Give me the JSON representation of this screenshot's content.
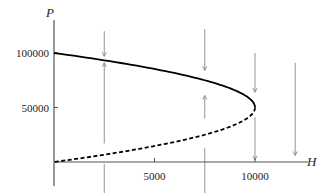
{
  "chart_data": {
    "type": "line",
    "title": "",
    "xlabel": "H",
    "ylabel": "P",
    "xlim": [
      0,
      13000
    ],
    "ylim": [
      -20000,
      115000
    ],
    "x_ticks": [
      5000,
      10000
    ],
    "x_tick_labels": [
      "5000",
      "10000"
    ],
    "y_ticks": [
      50000,
      100000
    ],
    "y_tick_labels": [
      "50000",
      "100000"
    ],
    "grid": false,
    "legend": null,
    "series": [
      {
        "name": "stable equilibrium",
        "style": "solid",
        "color": "#000000",
        "x": [
          0,
          1900,
          3600,
          5100,
          6400,
          7500,
          8400,
          9100,
          9600,
          9900,
          10000
        ],
        "y": [
          100000,
          95000,
          90000,
          85000,
          80000,
          75000,
          70000,
          65000,
          60000,
          55000,
          50000
        ]
      },
      {
        "name": "unstable equilibrium",
        "style": "dashed",
        "color": "#000000",
        "x": [
          10000,
          9900,
          9600,
          9100,
          8400,
          7500,
          6400,
          5100,
          3600,
          1900,
          0
        ],
        "y": [
          50000,
          45000,
          40000,
          35000,
          30000,
          25000,
          20000,
          15000,
          10000,
          5000,
          0
        ]
      }
    ],
    "direction_arrows": [
      {
        "H": 2500,
        "from_P": 120000,
        "to_P": 97000,
        "direction": "down"
      },
      {
        "H": 2500,
        "from_P": 17000,
        "to_P": 91000,
        "direction": "up"
      },
      {
        "H": 2500,
        "from_P": -2000,
        "to_P": -43000,
        "direction": "down"
      },
      {
        "H": 7500,
        "from_P": 122000,
        "to_P": 84000,
        "direction": "down"
      },
      {
        "H": 7500,
        "from_P": 40000,
        "to_P": 61000,
        "direction": "up"
      },
      {
        "H": 7500,
        "from_P": 13000,
        "to_P": -38000,
        "direction": "down"
      },
      {
        "H": 10000,
        "from_P": 100000,
        "to_P": 64000,
        "direction": "down"
      },
      {
        "H": 10000,
        "from_P": 41000,
        "to_P": 2000,
        "direction": "down"
      },
      {
        "H": 12000,
        "from_P": 91000,
        "to_P": 6000,
        "direction": "down"
      }
    ],
    "colors": {
      "curve": "#000000",
      "arrows": "#888888",
      "axes": "#555555"
    }
  }
}
